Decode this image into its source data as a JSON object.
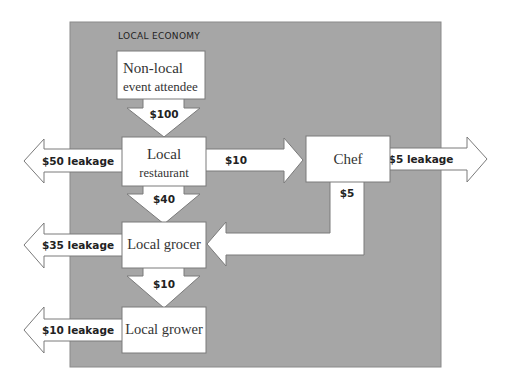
{
  "diagram": {
    "region_label": "LOCAL ECONOMY",
    "colors": {
      "region_fill": "#a6a6a6",
      "shape_fill": "#ffffff",
      "outline": "#7a7a7a"
    },
    "nodes": {
      "attendee": {
        "line1": "Non-local",
        "line2": "event attendee"
      },
      "restaurant": {
        "line1": "Local",
        "line2": "restaurant"
      },
      "chef": {
        "label": "Chef"
      },
      "grocer": {
        "label": "Local grocer"
      },
      "grower": {
        "label": "Local grower"
      }
    },
    "flows": {
      "attendee_to_restaurant": "$100",
      "restaurant_to_chef": "$10",
      "restaurant_to_grocer": "$40",
      "chef_to_grocer": "$5",
      "grocer_to_grower": "$10"
    },
    "leakages": {
      "restaurant": "$50 leakage",
      "chef": "$5 leakage",
      "grocer": "$35 leakage",
      "grower": "$10 leakage"
    }
  }
}
